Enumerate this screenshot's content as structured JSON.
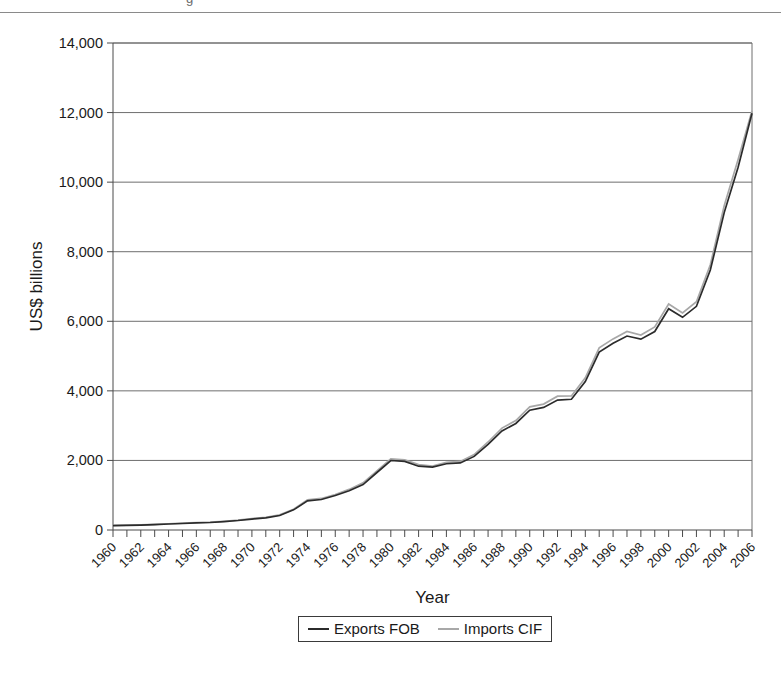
{
  "page": {
    "top_fragment": "g"
  },
  "chart_data": {
    "type": "line",
    "title": "",
    "xlabel": "Year",
    "ylabel": "US$ billions",
    "xlim": [
      1960,
      2006
    ],
    "ylim": [
      0,
      14000
    ],
    "ytick_step": 2000,
    "ytick_labels": [
      "0",
      "2,000",
      "4,000",
      "6,000",
      "8,000",
      "10,000",
      "12,000",
      "14,000"
    ],
    "ytick_values": [
      0,
      2000,
      4000,
      6000,
      8000,
      10000,
      12000,
      14000
    ],
    "xtick_labels": [
      "1960",
      "1962",
      "1964",
      "1966",
      "1968",
      "1970",
      "1972",
      "1974",
      "1976",
      "1978",
      "1980",
      "1982",
      "1984",
      "1986",
      "1988",
      "1990",
      "1992",
      "1994",
      "1996",
      "1998",
      "2000",
      "2002",
      "2004",
      "2006"
    ],
    "xtick_label_rotation": 45,
    "xtick_every_years": 1,
    "xtick_label_every_years": 2,
    "grid": "horizontal",
    "legend_position": "bottom",
    "x": [
      1960,
      1961,
      1962,
      1963,
      1964,
      1965,
      1966,
      1967,
      1968,
      1969,
      1970,
      1971,
      1972,
      1973,
      1974,
      1975,
      1976,
      1977,
      1978,
      1979,
      1980,
      1981,
      1982,
      1983,
      1984,
      1985,
      1986,
      1987,
      1988,
      1989,
      1990,
      1991,
      1992,
      1993,
      1994,
      1995,
      1996,
      1997,
      1998,
      1999,
      2000,
      2001,
      2002,
      2003,
      2004,
      2005,
      2006
    ],
    "series": [
      {
        "name": "Exports FOB",
        "color": "#2b2b2b",
        "values": [
          128,
          135,
          142,
          155,
          173,
          187,
          205,
          215,
          240,
          273,
          315,
          350,
          417,
          579,
          838,
          877,
          991,
          1126,
          1307,
          1653,
          1998,
          1972,
          1834,
          1806,
          1905,
          1927,
          2116,
          2463,
          2846,
          3062,
          3444,
          3523,
          3735,
          3758,
          4269,
          5113,
          5366,
          5576,
          5487,
          5706,
          6361,
          6114,
          6431,
          7473,
          9124,
          10431,
          11980
        ]
      },
      {
        "name": "Imports CIF",
        "color": "#a8a8a8",
        "values": [
          134,
          140,
          148,
          161,
          180,
          196,
          215,
          226,
          252,
          286,
          330,
          367,
          435,
          598,
          866,
          907,
          1022,
          1167,
          1355,
          1702,
          2046,
          2017,
          1878,
          1840,
          1943,
          1971,
          2170,
          2530,
          2930,
          3148,
          3541,
          3620,
          3847,
          3854,
          4374,
          5236,
          5494,
          5706,
          5606,
          5839,
          6497,
          6242,
          6561,
          7627,
          9321,
          10649,
          12050
        ]
      }
    ]
  },
  "legend": {
    "entries": [
      {
        "label": "Exports FOB",
        "color": "#2b2b2b"
      },
      {
        "label": "Imports CIF",
        "color": "#a8a8a8"
      }
    ]
  }
}
